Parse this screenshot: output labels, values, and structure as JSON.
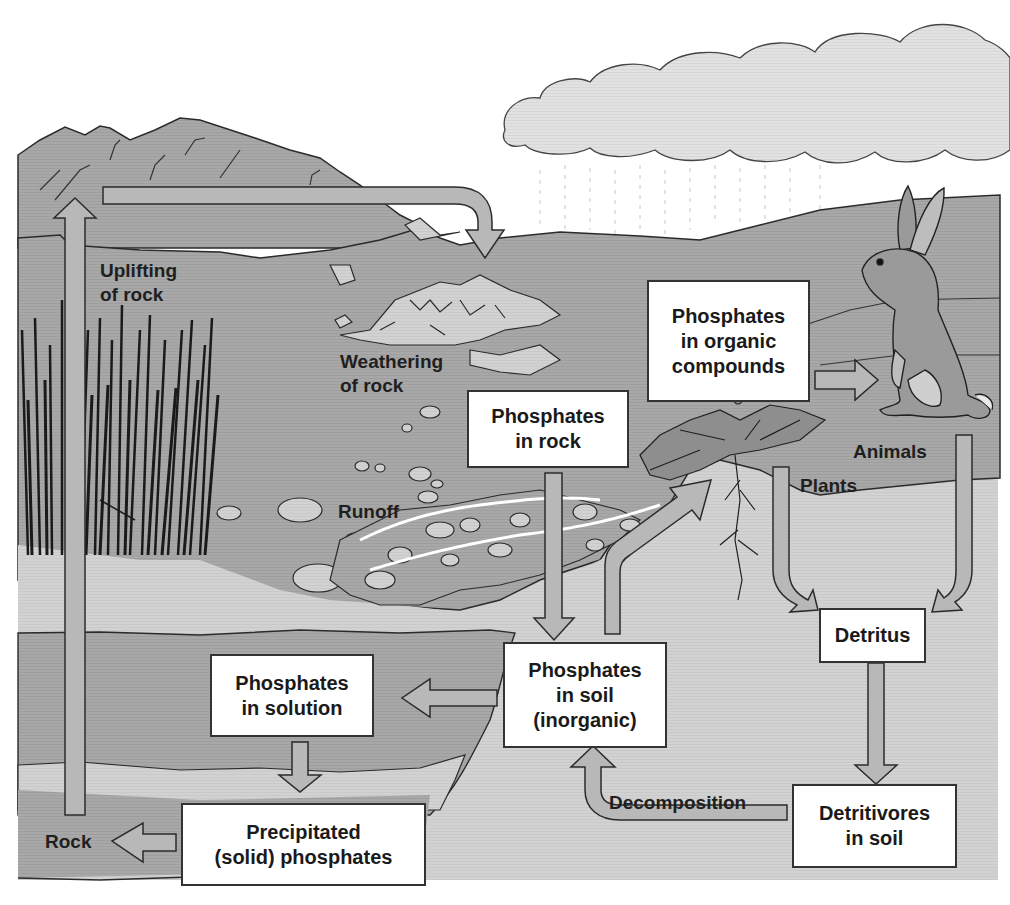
{
  "diagram": {
    "colors": {
      "ground": "#a9a9a9",
      "soil_light": "#d4d4d4",
      "sediment": "#b3b3b3",
      "box_fill": "#ffffff",
      "box_border": "#333333",
      "arrow_fill": "#b8b8b8",
      "outline": "#2b2b2b"
    },
    "boxes": {
      "phosphates_organic": "Phosphates\nin organic\ncompounds",
      "phosphates_rock": "Phosphates\nin rock",
      "phosphates_soil": "Phosphates\nin soil\n(inorganic)",
      "phosphates_solution": "Phosphates\nin solution",
      "precipitated": "Precipitated\n(solid) phosphates",
      "detritus": "Detritus",
      "detritivores": "Detritivores\nin soil"
    },
    "labels": {
      "uplifting": "Uplifting\nof rock",
      "weathering": "Weathering\nof rock",
      "runoff": "Runoff",
      "animals": "Animals",
      "plants": "Plants",
      "decomposition": "Decomposition",
      "rock": "Rock"
    },
    "illustrations": [
      "mountains",
      "cloud",
      "rain",
      "rabbit",
      "dandelion",
      "reeds",
      "stones"
    ],
    "arrows": [
      {
        "from": "rock",
        "to": "mountains",
        "label": "Uplifting of rock"
      },
      {
        "from": "mountains",
        "to": "weathering",
        "label": "Weathering of rock"
      },
      {
        "from": "phosphates_rock",
        "to": "phosphates_soil"
      },
      {
        "from": "phosphates_soil",
        "to": "plants"
      },
      {
        "from": "phosphates_organic",
        "to": "rabbit"
      },
      {
        "from": "plants",
        "to": "detritus",
        "label": "Plants"
      },
      {
        "from": "animals",
        "to": "detritus",
        "label": "Animals"
      },
      {
        "from": "detritus",
        "to": "detritivores"
      },
      {
        "from": "detritivores",
        "to": "phosphates_soil",
        "label": "Decomposition"
      },
      {
        "from": "phosphates_soil",
        "to": "phosphates_solution"
      },
      {
        "from": "phosphates_solution",
        "to": "precipitated"
      },
      {
        "from": "precipitated",
        "to": "rock"
      }
    ]
  }
}
